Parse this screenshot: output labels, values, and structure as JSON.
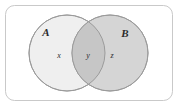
{
  "figure": {
    "name": "venn-diagram-two-sets",
    "canvas": {
      "width": 178,
      "height": 108
    },
    "background_color": "#ffffff"
  },
  "universe": {
    "name": "universal-set-rectangle",
    "x": 5,
    "y": 5,
    "width": 168,
    "height": 96,
    "corner_radius": 9,
    "fill_color": "#ffffff",
    "stroke_color": "#c9c9c9",
    "stroke_width": 1
  },
  "sets": [
    {
      "id": "A",
      "label": "A",
      "label_x": 46,
      "label_y": 36,
      "cx": 67,
      "cy": 53,
      "r": 38,
      "fill_color": "#efefef",
      "stroke_color": "#9b9b9b",
      "stroke_width": 1
    },
    {
      "id": "B",
      "label": "B",
      "label_x": 125,
      "label_y": 37,
      "cx": 110,
      "cy": 53,
      "r": 38,
      "fill_color": "#d5d5d5",
      "stroke_color": "#9b9b9b",
      "stroke_width": 1
    }
  ],
  "intersection": {
    "name": "intersection-lens",
    "fill_color": "#c6c6c6",
    "stroke_color": "#9b9b9b"
  },
  "region_labels": [
    {
      "id": "x",
      "label": "x",
      "x": 59,
      "y": 58,
      "region": "A only"
    },
    {
      "id": "y",
      "label": "y",
      "x": 88,
      "y": 58,
      "region": "A and B"
    },
    {
      "id": "z",
      "label": "z",
      "x": 112,
      "y": 58,
      "region": "B only"
    }
  ]
}
